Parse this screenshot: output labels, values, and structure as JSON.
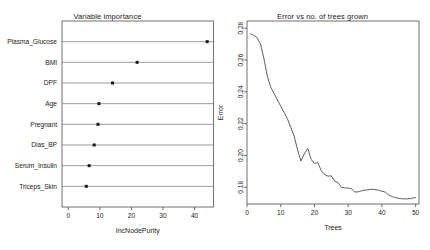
{
  "figure": {
    "background_color": "#ffffff",
    "foreground_color": "#1a1a1a",
    "panels": 2
  },
  "left_panel": {
    "title": "Variable importance",
    "xlabel": "IncNodePurity"
  },
  "right_panel": {
    "title": "Error vs no. of trees grown",
    "xlabel": "Trees",
    "ylabel": "Error"
  },
  "chart_data": [
    {
      "type": "bar",
      "subtype": "dotchart",
      "title": "Variable importance",
      "xlabel": "IncNodePurity",
      "ylabel": "",
      "categories": [
        "Plasma_Glucose",
        "BMI",
        "DPF",
        "Age",
        "Pregnant",
        "Dias_BP",
        "Serum_Insulin",
        "Triceps_Skin"
      ],
      "values": [
        44.0,
        21.8,
        14.0,
        9.7,
        9.4,
        8.2,
        6.6,
        5.7
      ],
      "xlim": [
        -2.0,
        46.0
      ],
      "xticks": [
        0,
        10,
        20,
        30,
        40
      ],
      "xticklabels": [
        "0",
        "10",
        "20",
        "30",
        "40"
      ],
      "grid": "horizontal-rules-per-category",
      "legend": "none",
      "marker": "filled-square"
    },
    {
      "type": "line",
      "title": "Error vs no. of trees grown",
      "xlabel": "Trees",
      "ylabel": "Error",
      "xlim": [
        0.0,
        51.0
      ],
      "ylim": [
        0.1695,
        0.2845
      ],
      "xticks": [
        0,
        10,
        20,
        30,
        40,
        50
      ],
      "xticklabels": [
        "0",
        "10",
        "20",
        "30",
        "40",
        "50"
      ],
      "yticks": [
        0.18,
        0.2,
        0.22,
        0.24,
        0.26,
        0.28
      ],
      "yticklabels": [
        "0.18",
        "0.20",
        "0.22",
        "0.24",
        "0.26",
        "0.28"
      ],
      "grid": false,
      "legend": "none",
      "x": [
        1,
        2,
        3,
        4,
        5,
        6,
        7,
        8,
        9,
        10,
        11,
        12,
        13,
        14,
        15,
        16,
        17,
        18,
        19,
        20,
        21,
        22,
        23,
        24,
        25,
        26,
        27,
        28,
        29,
        30,
        31,
        32,
        33,
        34,
        35,
        36,
        37,
        38,
        39,
        40,
        41,
        42,
        43,
        44,
        45,
        46,
        47,
        48,
        49,
        50
      ],
      "series": [
        {
          "name": "OOB error",
          "values": [
            0.2765,
            0.2755,
            0.274,
            0.27,
            0.261,
            0.25,
            0.243,
            0.239,
            0.235,
            0.231,
            0.227,
            0.223,
            0.2175,
            0.212,
            0.2035,
            0.1965,
            0.201,
            0.2045,
            0.1975,
            0.195,
            0.1955,
            0.1905,
            0.188,
            0.187,
            0.1872,
            0.1838,
            0.183,
            0.18,
            0.1796,
            0.1795,
            0.179,
            0.177,
            0.1772,
            0.1778,
            0.1782,
            0.1785,
            0.1788,
            0.1785,
            0.1782,
            0.1775,
            0.177,
            0.1752,
            0.1742,
            0.1735,
            0.173,
            0.1728,
            0.1727,
            0.1728,
            0.1732,
            0.1735
          ]
        }
      ]
    }
  ]
}
